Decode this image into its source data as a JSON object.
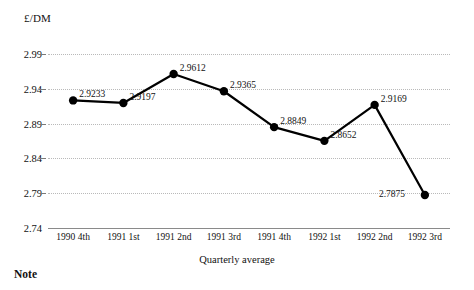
{
  "chart_data": {
    "type": "line",
    "title": "",
    "ylabel": "£/DM",
    "xlabel": "Quarterly average",
    "categories": [
      "1990 4th",
      "1991 1st",
      "1991 2nd",
      "1991 3rd",
      "1991 4th",
      "1992 1st",
      "1992 2nd",
      "1992 3rd"
    ],
    "values": [
      2.9233,
      2.9197,
      2.9612,
      2.9365,
      2.8849,
      2.8652,
      2.9169,
      2.7875
    ],
    "point_labels": [
      "2.9233",
      "2.9197",
      "2.9612",
      "2.9365",
      "2.8849",
      "2.8652",
      "2.9169",
      "2.7875"
    ],
    "ylim": [
      2.74,
      2.99
    ],
    "yticks": [
      2.99,
      2.94,
      2.89,
      2.84,
      2.79,
      2.74
    ],
    "ytick_labels": [
      "2.99",
      "2.94",
      "2.89",
      "2.84",
      "2.79",
      "2.74"
    ],
    "grid": true,
    "legend": "none",
    "line_color": "#000000",
    "marker_color": "#000000",
    "gridline_color": "#b9b9b9",
    "axis_color": "#8a8a8a"
  },
  "footer": {
    "note_heading": "Note"
  }
}
